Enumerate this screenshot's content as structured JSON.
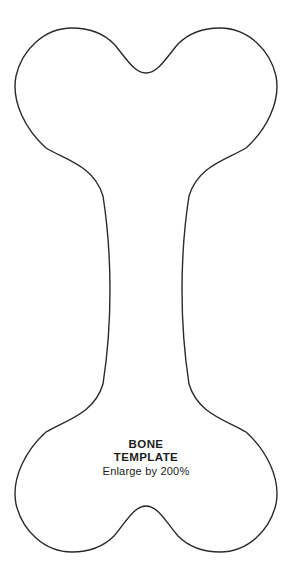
{
  "page": {
    "background_color": "#ffffff",
    "outline_color": "#2a2a2a",
    "outline_width": "1.4"
  },
  "template": {
    "shape": "dog-bone-outline",
    "title_line1": "BONE",
    "title_line2": "TEMPLATE",
    "instruction": "Enlarge by 200%"
  }
}
